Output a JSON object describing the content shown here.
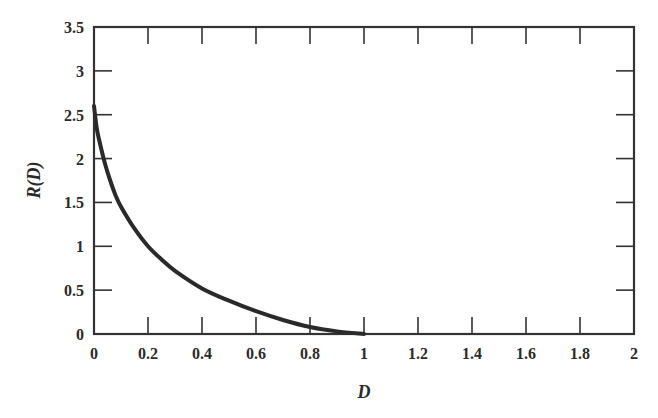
{
  "chart_data": {
    "type": "line",
    "title": "",
    "xlabel": "D",
    "ylabel": "R(D)",
    "xlim": [
      0,
      2
    ],
    "ylim": [
      0,
      3.5
    ],
    "grid": false,
    "legend": null,
    "x_ticks": [
      "0",
      "0.2",
      "0.4",
      "0.6",
      "0.8",
      "1",
      "1.2",
      "1.4",
      "1.6",
      "1.8",
      "2"
    ],
    "y_ticks": [
      "0",
      "0.5",
      "1",
      "1.5",
      "2",
      "2.5",
      "3",
      "3.5"
    ],
    "series": [
      {
        "name": "R(D)",
        "x": [
          0.0,
          0.01,
          0.02,
          0.04,
          0.06,
          0.08,
          0.1,
          0.15,
          0.2,
          0.25,
          0.3,
          0.4,
          0.5,
          0.6,
          0.7,
          0.8,
          0.9,
          1.0
        ],
        "y": [
          2.6,
          2.35,
          2.2,
          1.95,
          1.75,
          1.58,
          1.45,
          1.2,
          1.0,
          0.85,
          0.72,
          0.52,
          0.38,
          0.26,
          0.16,
          0.08,
          0.03,
          0.0
        ]
      }
    ]
  },
  "plot": {
    "left": 94,
    "right": 634,
    "top": 27,
    "bottom": 334,
    "line_color": "#2a2a2a",
    "axis_color": "#333333"
  }
}
